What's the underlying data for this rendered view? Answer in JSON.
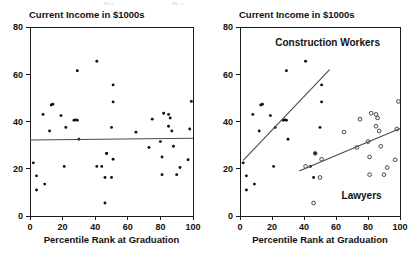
{
  "figure": {
    "width": 415,
    "height": 258,
    "background": "#ffffff",
    "ink_color": "#111111",
    "fit_line_color": "#4a4a4a"
  },
  "panels": [
    {
      "id": "left",
      "name": "pooled-scatter",
      "header": "Current Income in $1000s",
      "xlabel": "Percentile Rank at Graduation",
      "ylabel": "",
      "frame": {
        "x": 30,
        "y": 27,
        "w": 163,
        "h": 189
      },
      "xlim": [
        0,
        100
      ],
      "ylim": [
        0,
        80
      ],
      "xticks": [
        0,
        20,
        40,
        60,
        80,
        100
      ],
      "yticks": [
        0,
        20,
        40,
        60,
        80
      ],
      "group_labels": []
    },
    {
      "id": "right",
      "name": "grouped-scatter",
      "header": "Current Income in $1000s",
      "xlabel": "Percentile Rank at Graduation",
      "ylabel": "",
      "frame": {
        "x": 240,
        "y": 27,
        "w": 160,
        "h": 189
      },
      "xlim": [
        0,
        100
      ],
      "ylim": [
        0,
        80
      ],
      "xticks": [
        0,
        20,
        40,
        60,
        80,
        100
      ],
      "yticks": [
        0,
        20,
        40,
        60,
        80
      ],
      "group_labels": [
        {
          "text": "Construction Workers",
          "x": 22,
          "y": 72,
          "anchor": "start"
        },
        {
          "text": "Lawyers",
          "x": 76,
          "y": 7,
          "anchor": "middle"
        }
      ]
    }
  ],
  "chart_data": {
    "type": "scatter",
    "title": "",
    "panel_header": "Current Income in $1000s",
    "xlabel": "Percentile Rank at Graduation",
    "ylabel": "Current Income in $1000s",
    "xlim": [
      0,
      100
    ],
    "ylim": [
      0,
      80
    ],
    "xticks": [
      0,
      20,
      40,
      60,
      80,
      100
    ],
    "yticks": [
      0,
      20,
      40,
      60,
      80
    ],
    "grid": false,
    "legend": "in-plot-annotations",
    "panel_count": 2,
    "note": "Same 40 observations plotted twice: pooled on the left with a flat overall regression line, and split by occupation on the right where each subgroup shows a positive slope (Simpson's paradox illustration).",
    "series": [
      {
        "name": "Construction Workers",
        "marker": "filled-circle",
        "points": [
          [
            2,
            22.5
          ],
          [
            4,
            17.0
          ],
          [
            4,
            11.0
          ],
          [
            8,
            43.0
          ],
          [
            9,
            13.5
          ],
          [
            12,
            36.0
          ],
          [
            13,
            47.0
          ],
          [
            14,
            47.3
          ],
          [
            19,
            42.5
          ],
          [
            21,
            21.0
          ],
          [
            22,
            37.5
          ],
          [
            27,
            40.5
          ],
          [
            28,
            40.7
          ],
          [
            29,
            40.5
          ],
          [
            29,
            61.5
          ],
          [
            30,
            32.5
          ],
          [
            41,
            65.5
          ],
          [
            44,
            21.0
          ],
          [
            46,
            16.3
          ],
          [
            47,
            26.5
          ],
          [
            50,
            37.5
          ],
          [
            51,
            48.3
          ],
          [
            51,
            55.5
          ]
        ]
      },
      {
        "name": "Lawyers",
        "marker": "open-circle",
        "points": [
          [
            41,
            21.0
          ],
          [
            46,
            5.5
          ],
          [
            47,
            26.5
          ],
          [
            50,
            16.3
          ],
          [
            51,
            24.0
          ],
          [
            65,
            35.5
          ],
          [
            73,
            29.0
          ],
          [
            75,
            41.0
          ],
          [
            80,
            31.5
          ],
          [
            81,
            25.0
          ],
          [
            81,
            17.5
          ],
          [
            82,
            43.5
          ],
          [
            85,
            43.0
          ],
          [
            85,
            38.0
          ],
          [
            86,
            41.5
          ],
          [
            87,
            36.0
          ],
          [
            88,
            29.5
          ],
          [
            90,
            17.5
          ],
          [
            92,
            20.5
          ],
          [
            97,
            23.8
          ],
          [
            98,
            36.8
          ],
          [
            99,
            48.5
          ]
        ]
      }
    ],
    "fit_lines": [
      {
        "panel": "left",
        "name": "pooled-regression",
        "label": "Pooled fit (flat)",
        "x0": 0,
        "y0": 32.2,
        "x1": 100,
        "y1": 32.9
      },
      {
        "panel": "right",
        "name": "construction-workers-regression",
        "label": "Construction Workers fit",
        "x0": 2,
        "y0": 23.5,
        "x1": 56,
        "y1": 62.0
      },
      {
        "panel": "right",
        "name": "lawyers-regression",
        "label": "Lawyers fit",
        "x0": 37,
        "y0": 19.0,
        "x1": 100,
        "y1": 37.0
      }
    ]
  }
}
